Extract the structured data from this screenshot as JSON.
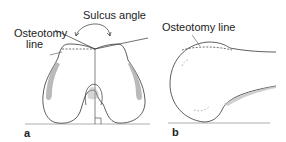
{
  "figure": {
    "panel_a": {
      "letter": "a",
      "labels": {
        "sulcus_angle": "Sulcus angle",
        "osteotomy_line_1": "Osteotomy",
        "osteotomy_line_2": "line"
      }
    },
    "panel_b": {
      "letter": "b",
      "labels": {
        "osteotomy_line": "Osteotomy line"
      }
    },
    "colors": {
      "stroke": "#333333",
      "shading": "#999999",
      "background": "#ffffff"
    }
  }
}
